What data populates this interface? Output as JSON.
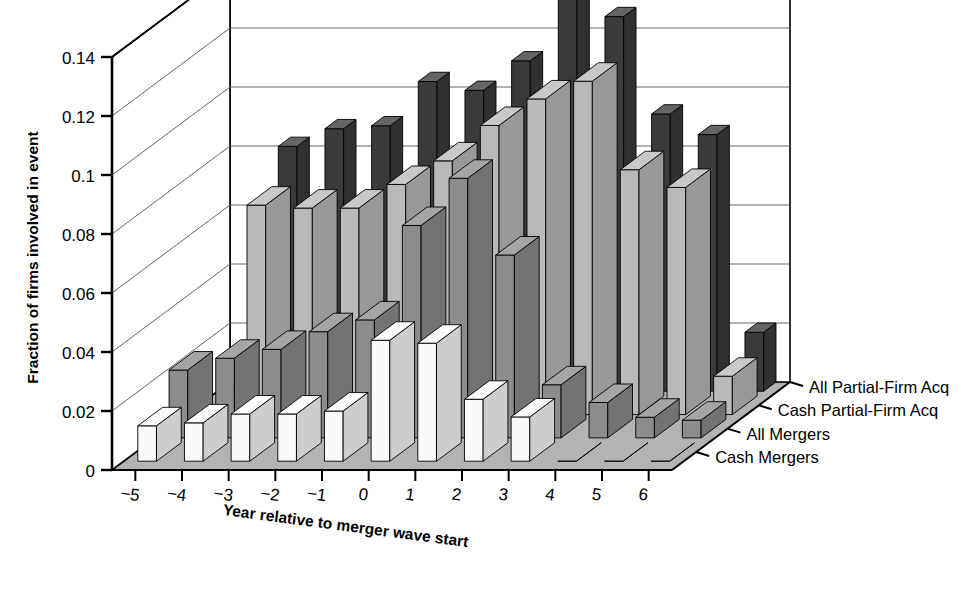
{
  "chart_data": {
    "type": "bar",
    "title": "",
    "subtitle": "",
    "xlabel": "Year relative to merger wave start",
    "ylabel": "Fraction of firms involved in event",
    "zlabel": "",
    "projection": "3d-grouped-bar",
    "grid": true,
    "legend_position": "right-depth-axis",
    "categories": [
      "-5",
      "-4",
      "-3",
      "-2",
      "-1",
      "0",
      "1",
      "2",
      "3",
      "4",
      "5",
      "6"
    ],
    "x": [
      -5,
      -4,
      -3,
      -2,
      -1,
      0,
      1,
      2,
      3,
      4,
      5,
      6
    ],
    "ylim": [
      0,
      0.14
    ],
    "yticks": [
      "0",
      "0.02",
      "0.04",
      "0.06",
      "0.08",
      "0.1",
      "0.12",
      "0.14"
    ],
    "ytick_values": [
      0,
      0.02,
      0.04,
      0.06,
      0.08,
      0.1,
      0.12,
      0.14
    ],
    "series": [
      {
        "name": "All Partial-Firm Acq",
        "color": "#3a3a3a",
        "values": [
          0.0,
          0.083,
          0.089,
          0.09,
          0.105,
          0.102,
          0.112,
          0.133,
          0.127,
          0.094,
          0.087,
          0.02
        ]
      },
      {
        "name": "Cash Partial-Firm Acq",
        "color": "#b9b9b9",
        "values": [
          0.0,
          0.071,
          0.07,
          0.07,
          0.078,
          0.086,
          0.098,
          0.107,
          0.113,
          0.083,
          0.077,
          0.013
        ]
      },
      {
        "name": "All Mergers",
        "color": "#8c8c8c",
        "values": [
          0.023,
          0.027,
          0.03,
          0.036,
          0.04,
          0.072,
          0.088,
          0.062,
          0.018,
          0.012,
          0.007,
          0.006
        ]
      },
      {
        "name": "Cash Mergers",
        "color": "#fafafa",
        "values": [
          0.012,
          0.013,
          0.016,
          0.016,
          0.017,
          0.041,
          0.04,
          0.021,
          0.015,
          0.0,
          0.0,
          0.0
        ]
      }
    ]
  },
  "axes": {
    "y_title": "Fraction of firms involved in event",
    "x_title": "Year relative to merger wave start"
  },
  "legend": {
    "items": [
      {
        "label": "All Partial-Firm Acq"
      },
      {
        "label": "Cash Partial-Firm Acq"
      },
      {
        "label": "All Mergers"
      },
      {
        "label": "Cash Mergers"
      }
    ]
  },
  "colors": {
    "bar_all_partial": "#3a3a3a",
    "bar_cash_partial": "#b9b9b9",
    "bar_all_mergers": "#8c8c8c",
    "bar_cash_mergers": "#fafafa",
    "floor": "#b3b3b3",
    "wall": "#ffffff",
    "axis": "#000000",
    "grid": "#555555"
  }
}
